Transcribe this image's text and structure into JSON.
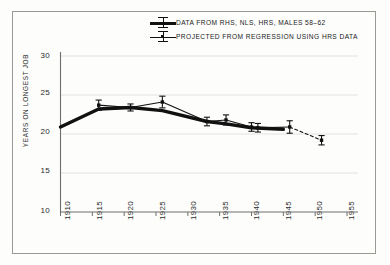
{
  "chart_data": {
    "type": "line",
    "title": "",
    "xlabel": "",
    "ylabel": "YEARS ON LONGEST JOB",
    "xlim": [
      1910,
      1955
    ],
    "ylim": [
      10,
      30
    ],
    "xticks": [
      1910,
      1915,
      1920,
      1925,
      1930,
      1935,
      1940,
      1945,
      1950,
      1955
    ],
    "yticks": [
      10,
      15,
      20,
      25,
      30
    ],
    "grid": true,
    "legend_position": "top-center",
    "series": [
      {
        "name": "DATA FROM RHS, NLS, HRS, MALES 58–62",
        "style": "thick-solid",
        "color": "#111111",
        "x": [
          1910,
          1916,
          1921,
          1926,
          1933,
          1936,
          1940,
          1945
        ],
        "values": [
          20.9,
          23.2,
          23.4,
          23.0,
          21.6,
          21.3,
          20.8,
          20.6
        ]
      },
      {
        "name": "PROJECTED FROM REGRESSION USING HRS DATA",
        "style": "thin-solid-with-error-bars",
        "color": "#111111",
        "x": [
          1916,
          1921,
          1926,
          1933,
          1936,
          1940,
          1941,
          1946
        ],
        "values": [
          23.7,
          23.4,
          24.1,
          21.6,
          21.8,
          20.9,
          20.8,
          20.9
        ],
        "errors": [
          0.65,
          0.45,
          0.75,
          0.55,
          0.65,
          0.55,
          0.55,
          0.8
        ]
      },
      {
        "name": "PROJECTED FROM REGRESSION USING HRS DATA (extrapolated)",
        "style": "dashed",
        "color": "#111111",
        "x": [
          1946,
          1951
        ],
        "values": [
          20.9,
          19.2
        ],
        "errors": [
          0.8,
          0.6
        ]
      }
    ]
  },
  "legend": {
    "items": [
      {
        "label": "DATA FROM RHS, NLS, HRS, MALES 58–62",
        "marker": "thick-line-with-errorbar"
      },
      {
        "label": "PROJECTED FROM REGRESSION USING HRS DATA",
        "marker": "thin-line-with-errorbar"
      }
    ]
  },
  "axes": {
    "y_title": "YEARS ON LONGEST JOB",
    "y_ticks": [
      "30",
      "25",
      "20",
      "15",
      "10"
    ],
    "x_ticks": [
      "1910",
      "1915",
      "1920",
      "1925",
      "1930",
      "1935",
      "1940",
      "1945",
      "1950",
      "1955"
    ]
  },
  "colors": {
    "ink": "#111111",
    "frame": "#9a9a94",
    "grid": "#e2e2de",
    "axis": "#6f6f6a",
    "background": "#fdfdfc"
  }
}
